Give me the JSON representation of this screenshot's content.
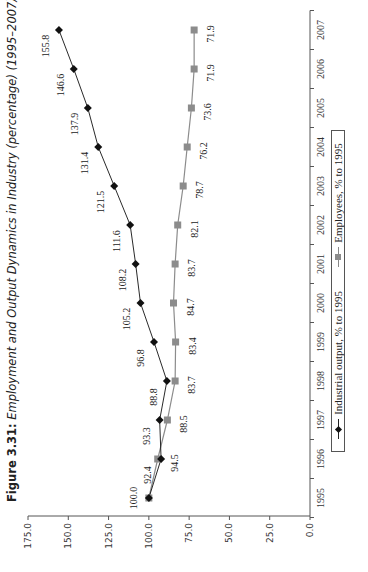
{
  "title": {
    "prefix": "Figure 3.31:",
    "text": "Employment and Output Dynamics in Industry (percentage) (1995–2007)"
  },
  "legend": {
    "items": [
      {
        "label": "Industrial output, % to 1995",
        "marker": "diamond",
        "color": "#111111"
      },
      {
        "label": "Employees, % to 1995",
        "marker": "square",
        "color": "#8c8c8c"
      }
    ]
  },
  "axes": {
    "y_ticks": [
      "175.0",
      "150.0",
      "125.0",
      "100.0",
      "75.0",
      "50.0",
      "25.0",
      "0.0"
    ],
    "x_ticks": [
      "1995",
      "1996",
      "1997",
      "1998",
      "1999",
      "2000",
      "2001",
      "2002",
      "2003",
      "2004",
      "2005",
      "2006",
      "2007"
    ]
  },
  "chart_data": {
    "type": "line",
    "title": "Figure 3.31: Employment and Output Dynamics in Industry (percentage) (1995–2007)",
    "x": [
      1995,
      1996,
      1997,
      1998,
      1999,
      2000,
      2001,
      2002,
      2003,
      2004,
      2005,
      2006,
      2007
    ],
    "series": [
      {
        "name": "Industrial output, % to 1995",
        "values": [
          100.0,
          92.4,
          93.3,
          88.8,
          96.8,
          105.2,
          108.2,
          111.6,
          121.5,
          131.4,
          137.9,
          146.6,
          155.8
        ]
      },
      {
        "name": "Employees, % to 1995",
        "values": [
          100.0,
          94.5,
          88.5,
          83.7,
          83.4,
          84.7,
          83.7,
          82.1,
          78.7,
          76.2,
          73.6,
          71.9,
          71.9
        ]
      }
    ],
    "xlabel": "",
    "ylabel": "",
    "ylim": [
      0,
      175
    ],
    "y_ticks": [
      0,
      25,
      50,
      75,
      100,
      125,
      150,
      175
    ],
    "grid": false,
    "legend_position": "bottom",
    "orientation": "rotated 90° counter-clockwise on page"
  },
  "colors": {
    "output": "#111111",
    "employees": "#8c8c8c",
    "axis": "#555555"
  }
}
